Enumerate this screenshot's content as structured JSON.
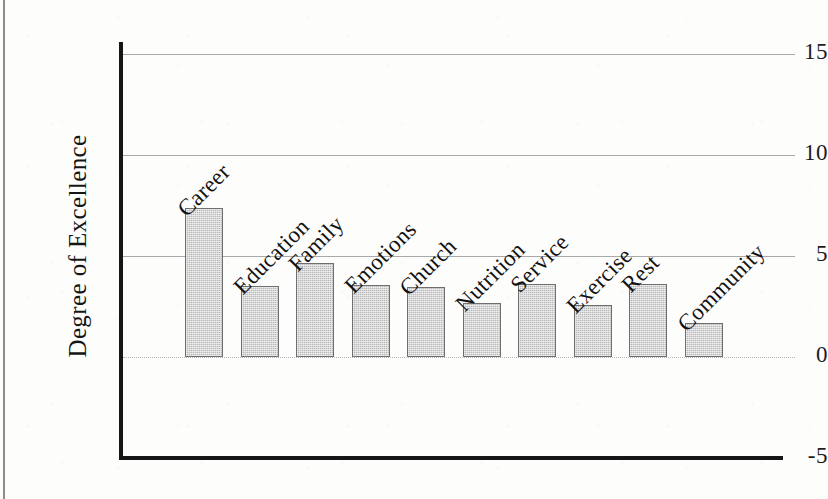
{
  "chart_data": {
    "type": "bar",
    "title": "",
    "subtitle": "",
    "xlabel": "",
    "ylabel": "Degree of Excellence",
    "ylim": [
      -5,
      15
    ],
    "yticks": [
      "15",
      "10",
      "5",
      "0",
      "-5"
    ],
    "ytick_values": [
      15,
      10,
      5,
      0,
      -5
    ],
    "grid": "horizontal",
    "legend": "none",
    "categories": [
      "Career",
      "Education",
      "Family",
      "Emotions",
      "Church",
      "Nutrition",
      "Service",
      "Exercise",
      "Rest",
      "Community"
    ],
    "values": [
      7.4,
      3.5,
      4.65,
      3.55,
      3.45,
      2.65,
      3.6,
      2.55,
      3.6,
      1.7
    ],
    "bar_color": "#b9b9b9",
    "bar_border_color": "#6f6f6f",
    "axis_color": "#161616",
    "grid_color": "#a9a9a9"
  }
}
